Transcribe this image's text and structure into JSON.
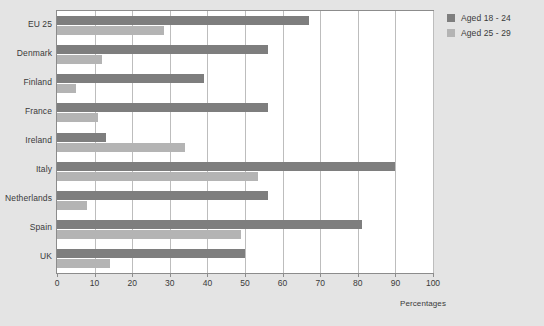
{
  "chart_data": {
    "type": "bar",
    "orientation": "horizontal",
    "title": "",
    "subtitle": "",
    "xlabel": "Percentages",
    "ylabel": "",
    "xlim": [
      0,
      100
    ],
    "xticks": [
      0,
      10,
      20,
      30,
      40,
      50,
      60,
      70,
      80,
      90,
      100
    ],
    "xtick_labels": [
      "0",
      "10",
      "20",
      "30",
      "40",
      "50",
      "60",
      "70",
      "80",
      "90",
      "100"
    ],
    "grid": "vertical",
    "legend_position": "right",
    "categories": [
      "EU 25",
      "Denmark",
      "Finland",
      "France",
      "Ireland",
      "Italy",
      "Netherlands",
      "Spain",
      "UK"
    ],
    "series": [
      {
        "name": "Aged 18 - 24",
        "color": "#7e7e7e",
        "values": [
          67,
          56,
          39,
          56,
          13,
          90,
          56,
          81,
          50
        ]
      },
      {
        "name": "Aged 25 - 29",
        "color": "#b4b4b4",
        "values": [
          28.5,
          12,
          5,
          11,
          34,
          53.5,
          8,
          49,
          14
        ]
      }
    ]
  },
  "legend": {
    "items": [
      {
        "label": "Aged 18 - 24",
        "swatch": "dark"
      },
      {
        "label": "Aged 25 - 29",
        "swatch": "light"
      }
    ]
  },
  "axis": {
    "x_title": "Percentages"
  },
  "colors": {
    "background": "#e4e4e4",
    "plot_background": "#ffffff",
    "gridline": "#bdbdbd",
    "frame": "#8c8c8c",
    "series_dark": "#7e7e7e",
    "series_light": "#b4b4b4",
    "text": "#3a3a3a"
  }
}
